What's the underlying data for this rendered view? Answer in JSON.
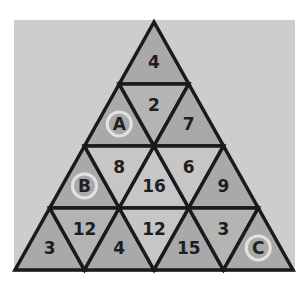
{
  "puzzle": {
    "colors": {
      "background": "#cdcdcd",
      "dark": "#a9a9a9",
      "medium": "#b4b4b4",
      "light": "#c6c6c6",
      "line": "#1a1a1a",
      "ring": "#e2e2e2"
    },
    "rows": [
      [
        {
          "dir": "up",
          "label": "4",
          "shade": "dark"
        }
      ],
      [
        {
          "dir": "up",
          "label": "A",
          "shade": "dark",
          "letter": true
        },
        {
          "dir": "down",
          "label": "2",
          "shade": "medium"
        },
        {
          "dir": "up",
          "label": "7",
          "shade": "dark"
        }
      ],
      [
        {
          "dir": "up",
          "label": "B",
          "shade": "dark",
          "letter": true
        },
        {
          "dir": "down",
          "label": "8",
          "shade": "light"
        },
        {
          "dir": "up",
          "label": "16",
          "shade": "light"
        },
        {
          "dir": "down",
          "label": "6",
          "shade": "light"
        },
        {
          "dir": "up",
          "label": "9",
          "shade": "dark"
        }
      ],
      [
        {
          "dir": "up",
          "label": "3",
          "shade": "dark"
        },
        {
          "dir": "down",
          "label": "12",
          "shade": "medium"
        },
        {
          "dir": "up",
          "label": "4",
          "shade": "dark"
        },
        {
          "dir": "down",
          "label": "12",
          "shade": "light"
        },
        {
          "dir": "up",
          "label": "15",
          "shade": "dark"
        },
        {
          "dir": "down",
          "label": "3",
          "shade": "medium"
        },
        {
          "dir": "up",
          "label": "C",
          "shade": "dark",
          "letter": true
        }
      ]
    ]
  }
}
